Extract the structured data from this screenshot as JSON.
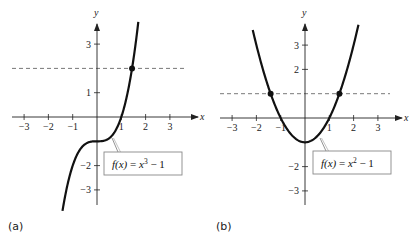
{
  "chart_data": [
    {
      "type": "line",
      "panel_label": "(a)",
      "function_label": {
        "lhs": "f(x)",
        "eq": "=",
        "rhs_base": "x",
        "rhs_exp": "3",
        "rhs_tail": "− 1"
      },
      "xlabel": "x",
      "ylabel": "y",
      "xlim": [
        -3.5,
        3.8
      ],
      "ylim": [
        -3.6,
        3.9
      ],
      "x_ticks": [
        -3,
        -2,
        -1,
        1,
        2,
        3
      ],
      "x_tick_labels": [
        "−3",
        "−2",
        "−1",
        "1",
        "2",
        "3"
      ],
      "y_ticks": [
        3,
        1,
        -2,
        -3
      ],
      "y_tick_labels": [
        "3",
        "1",
        "−2",
        "−3"
      ],
      "curve": "x^3 - 1",
      "curve_domain": [
        -1.42,
        1.7
      ],
      "horizontal_dashed_line": 2,
      "points": [
        {
          "x": 1.442,
          "y": 2
        }
      ],
      "grid": false
    },
    {
      "type": "line",
      "panel_label": "(b)",
      "function_label": {
        "lhs": "f(x)",
        "eq": "=",
        "rhs_base": "x",
        "rhs_exp": "2",
        "rhs_tail": "− 1"
      },
      "xlabel": "x",
      "ylabel": "y",
      "xlim": [
        -3.5,
        3.8
      ],
      "ylim": [
        -3.6,
        3.9
      ],
      "x_ticks": [
        -3,
        -2,
        -1,
        1,
        2,
        3
      ],
      "x_tick_labels": [
        "−3",
        "−2",
        "−1",
        "1",
        "2",
        "3"
      ],
      "y_ticks": [
        3,
        2,
        -2,
        -3
      ],
      "y_tick_labels": [
        "3",
        "2",
        "−2",
        "−3"
      ],
      "curve": "x^2 - 1",
      "curve_domain": [
        -2.15,
        2.2
      ],
      "horizontal_dashed_line": 1,
      "points": [
        {
          "x": -1.414,
          "y": 1
        },
        {
          "x": 1.414,
          "y": 1
        }
      ],
      "grid": false
    }
  ],
  "panels": {
    "a": {
      "label": "(a)",
      "x_axis_name": "x",
      "y_axis_name": "y"
    },
    "b": {
      "label": "(b)",
      "x_axis_name": "x",
      "y_axis_name": "y"
    }
  }
}
